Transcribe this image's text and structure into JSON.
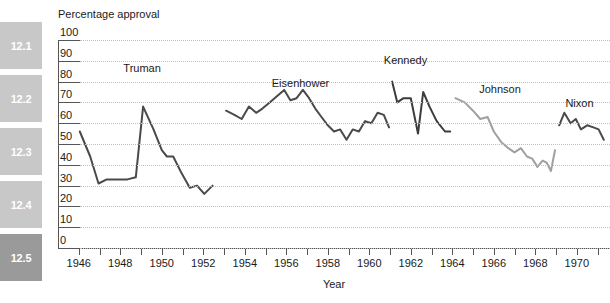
{
  "sidebar": {
    "tabs": [
      {
        "label": "12.1",
        "active": false,
        "color": "#c8c8c8"
      },
      {
        "label": "12.2",
        "active": false,
        "color": "#c8c8c8"
      },
      {
        "label": "12.3",
        "active": false,
        "color": "#c8c8c8"
      },
      {
        "label": "12.4",
        "active": false,
        "color": "#c8c8c8"
      },
      {
        "label": "12.5",
        "active": true,
        "color": "#9a9a9a"
      }
    ]
  },
  "chart_data": {
    "type": "line",
    "title": "Percentage approval",
    "xlabel": "Year",
    "ylabel": "Percentage approval",
    "xlim": [
      1945.0,
      1971.6
    ],
    "ylim": [
      0,
      100
    ],
    "grid": true,
    "legend_position": "inline-annotations",
    "y_ticks": [
      0,
      10,
      20,
      30,
      40,
      50,
      60,
      70,
      80,
      90,
      100
    ],
    "x_ticks": [
      1946,
      1947,
      1948,
      1949,
      1950,
      1951,
      1952,
      1953,
      1954,
      1955,
      1956,
      1957,
      1958,
      1959,
      1960,
      1961,
      1962,
      1963,
      1964,
      1965,
      1966,
      1967,
      1968,
      1969,
      1970,
      1971
    ],
    "x_tick_labels": [
      {
        "value": 1946,
        "label": "1946"
      },
      {
        "value": 1948,
        "label": "1948"
      },
      {
        "value": 1950,
        "label": "1950"
      },
      {
        "value": 1952,
        "label": "1952"
      },
      {
        "value": 1954,
        "label": "1954"
      },
      {
        "value": 1956,
        "label": "1956"
      },
      {
        "value": 1958,
        "label": "1958"
      },
      {
        "value": 1960,
        "label": "1960"
      },
      {
        "value": 1962,
        "label": "1962"
      },
      {
        "value": 1964,
        "label": "1964"
      },
      {
        "value": 1966,
        "label": "1966"
      },
      {
        "value": 1968,
        "label": "1968"
      },
      {
        "value": 1970,
        "label": "1970"
      }
    ],
    "annotations": [
      {
        "text": "Truman",
        "x": 1948.15,
        "y": 86
      },
      {
        "text": "Eisenhower",
        "x": 1955.3,
        "y": 79
      },
      {
        "text": "Kennedy",
        "x": 1960.7,
        "y": 90
      },
      {
        "text": "Johnson",
        "x": 1965.3,
        "y": 76
      },
      {
        "text": "Nixon",
        "x": 1969.45,
        "y": 69
      }
    ],
    "series": [
      {
        "name": "Truman",
        "color": "#4a4a4a",
        "width": 2.0,
        "points": [
          [
            1946.05,
            56
          ],
          [
            1946.55,
            44
          ],
          [
            1946.95,
            31
          ],
          [
            1947.35,
            33
          ],
          [
            1947.85,
            33
          ],
          [
            1948.35,
            33
          ],
          [
            1948.75,
            34
          ],
          [
            1949.1,
            68
          ],
          [
            1949.6,
            57
          ],
          [
            1950.0,
            47
          ],
          [
            1950.25,
            44
          ],
          [
            1950.55,
            44
          ],
          [
            1950.95,
            36
          ],
          [
            1951.35,
            29
          ],
          [
            1951.7,
            30
          ],
          [
            1952.05,
            26
          ],
          [
            1952.45,
            30
          ]
        ]
      },
      {
        "name": "Eisenhower",
        "color": "#4a4a4a",
        "width": 2.0,
        "points": [
          [
            1953.1,
            66
          ],
          [
            1953.5,
            64
          ],
          [
            1953.85,
            62
          ],
          [
            1954.2,
            68
          ],
          [
            1954.55,
            65
          ],
          [
            1954.85,
            67
          ],
          [
            1955.2,
            70
          ],
          [
            1955.55,
            73
          ],
          [
            1955.9,
            76
          ],
          [
            1956.2,
            71
          ],
          [
            1956.5,
            72
          ],
          [
            1956.8,
            76
          ],
          [
            1957.1,
            72
          ],
          [
            1957.4,
            67
          ],
          [
            1957.7,
            63
          ],
          [
            1958.0,
            59
          ],
          [
            1958.3,
            56
          ],
          [
            1958.6,
            57
          ],
          [
            1958.9,
            52
          ],
          [
            1959.2,
            57
          ],
          [
            1959.5,
            56
          ],
          [
            1959.8,
            61
          ],
          [
            1960.1,
            60
          ],
          [
            1960.4,
            65
          ],
          [
            1960.7,
            64
          ],
          [
            1960.95,
            58
          ]
        ]
      },
      {
        "name": "Kennedy",
        "color": "#3c3c3c",
        "width": 2.0,
        "points": [
          [
            1961.1,
            80
          ],
          [
            1961.35,
            70
          ],
          [
            1961.65,
            72
          ],
          [
            1962.0,
            72
          ],
          [
            1962.35,
            55
          ],
          [
            1962.6,
            75
          ],
          [
            1962.9,
            68
          ],
          [
            1963.25,
            61
          ],
          [
            1963.65,
            56
          ],
          [
            1963.9,
            56
          ]
        ]
      },
      {
        "name": "Johnson",
        "color": "#a0a0a0",
        "width": 2.0,
        "points": [
          [
            1964.15,
            72
          ],
          [
            1964.6,
            70
          ],
          [
            1965.0,
            66
          ],
          [
            1965.35,
            62
          ],
          [
            1965.7,
            63
          ],
          [
            1966.0,
            56
          ],
          [
            1966.35,
            51
          ],
          [
            1966.7,
            48
          ],
          [
            1967.0,
            46
          ],
          [
            1967.3,
            48
          ],
          [
            1967.6,
            44
          ],
          [
            1967.85,
            43
          ],
          [
            1968.1,
            39
          ],
          [
            1968.35,
            42
          ],
          [
            1968.55,
            41
          ],
          [
            1968.75,
            37
          ],
          [
            1968.95,
            47
          ]
        ]
      },
      {
        "name": "Nixon",
        "color": "#4a4a4a",
        "width": 2.0,
        "points": [
          [
            1969.15,
            59
          ],
          [
            1969.4,
            65
          ],
          [
            1969.7,
            60
          ],
          [
            1969.95,
            62
          ],
          [
            1970.2,
            57
          ],
          [
            1970.5,
            59
          ],
          [
            1970.8,
            58
          ],
          [
            1971.05,
            57
          ],
          [
            1971.3,
            52
          ]
        ]
      }
    ]
  }
}
